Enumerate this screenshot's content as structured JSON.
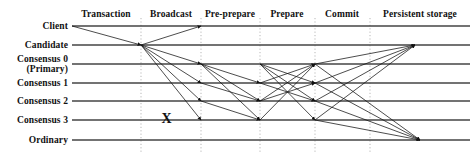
{
  "figure": {
    "width": 474,
    "height": 156,
    "background_color": "#ffffff",
    "line_color": "#444444",
    "arrow_color": "#111111",
    "divider_color": "#999999"
  },
  "phases": [
    {
      "label": "Transaction",
      "center_x": 106,
      "start_x": 72,
      "end_x": 141
    },
    {
      "label": "Broadcast",
      "center_x": 171,
      "start_x": 141,
      "end_x": 201
    },
    {
      "label": "Pre-prepare",
      "center_x": 230,
      "start_x": 201,
      "end_x": 260
    },
    {
      "label": "Prepare",
      "center_x": 287,
      "start_x": 260,
      "end_x": 315
    },
    {
      "label": "Commit",
      "center_x": 342,
      "start_x": 315,
      "end_x": 370
    },
    {
      "label": "Persistent storage",
      "center_x": 420,
      "start_x": 370,
      "end_x": 470
    }
  ],
  "phase_header_y": 10,
  "dividers_x": [
    141,
    201,
    260,
    315,
    370
  ],
  "divider_top_y": 18,
  "divider_bottom_y": 152,
  "lanes": [
    {
      "id": "client",
      "label": "Client",
      "label_lines": [
        "Client"
      ],
      "y": 26
    },
    {
      "id": "candidate",
      "label": "Candidate",
      "label_lines": [
        "Candidate"
      ],
      "y": 45
    },
    {
      "id": "consensus0",
      "label": "Consensus 0 (Primary)",
      "label_lines": [
        "Consensus 0",
        "(Primary)"
      ],
      "y": 64
    },
    {
      "id": "consensus1",
      "label": "Consensus 1",
      "label_lines": [
        "Consensus 1"
      ],
      "y": 83
    },
    {
      "id": "consensus2",
      "label": "Consensus 2",
      "label_lines": [
        "Consensus 2"
      ],
      "y": 101
    },
    {
      "id": "consensus3",
      "label": "Consensus 3",
      "label_lines": [
        "Consensus 3"
      ],
      "y": 120
    },
    {
      "id": "ordinary",
      "label": "Ordinary",
      "label_lines": [
        "Ordinary"
      ],
      "y": 140
    }
  ],
  "lane_line_start_x": 72,
  "lane_line_end_x": 470,
  "fail_marker": {
    "symbol": "X",
    "lane": "consensus3",
    "x": 166,
    "y": 120,
    "meaning": "faulty-node-marker"
  },
  "messages": [
    {
      "phase": "Transaction",
      "from_lane": "client",
      "to_lane": "candidate",
      "x1": 72,
      "y1": 26,
      "x2": 141,
      "y2": 45
    },
    {
      "phase": "Broadcast",
      "from_lane": "candidate",
      "to_lane": "client",
      "x1": 141,
      "y1": 45,
      "x2": 201,
      "y2": 26
    },
    {
      "phase": "Broadcast",
      "from_lane": "candidate",
      "to_lane": "consensus0",
      "x1": 141,
      "y1": 45,
      "x2": 201,
      "y2": 64
    },
    {
      "phase": "Broadcast",
      "from_lane": "candidate",
      "to_lane": "consensus1",
      "x1": 141,
      "y1": 45,
      "x2": 201,
      "y2": 83
    },
    {
      "phase": "Broadcast",
      "from_lane": "candidate",
      "to_lane": "consensus2",
      "x1": 141,
      "y1": 45,
      "x2": 201,
      "y2": 101
    },
    {
      "phase": "Broadcast",
      "from_lane": "candidate",
      "to_lane": "consensus3",
      "x1": 141,
      "y1": 45,
      "x2": 201,
      "y2": 120
    },
    {
      "phase": "Pre-prepare",
      "from_lane": "consensus0",
      "to_lane": "consensus1",
      "x1": 201,
      "y1": 64,
      "x2": 260,
      "y2": 83
    },
    {
      "phase": "Pre-prepare",
      "from_lane": "consensus0",
      "to_lane": "consensus2",
      "x1": 201,
      "y1": 64,
      "x2": 260,
      "y2": 101
    },
    {
      "phase": "Pre-prepare",
      "from_lane": "consensus0",
      "to_lane": "consensus3",
      "x1": 201,
      "y1": 64,
      "x2": 260,
      "y2": 120
    },
    {
      "phase": "Pre-prepare",
      "from_lane": "consensus1",
      "to_lane": "consensus2",
      "x1": 201,
      "y1": 83,
      "x2": 260,
      "y2": 101
    },
    {
      "phase": "Pre-prepare",
      "from_lane": "consensus2",
      "to_lane": "consensus3",
      "x1": 201,
      "y1": 101,
      "x2": 260,
      "y2": 120
    },
    {
      "phase": "Prepare",
      "from_lane": "consensus1",
      "to_lane": "consensus0",
      "x1": 260,
      "y1": 83,
      "x2": 315,
      "y2": 64
    },
    {
      "phase": "Prepare",
      "from_lane": "consensus2",
      "to_lane": "consensus0",
      "x1": 260,
      "y1": 101,
      "x2": 315,
      "y2": 64
    },
    {
      "phase": "Prepare",
      "from_lane": "consensus3",
      "to_lane": "consensus0",
      "x1": 260,
      "y1": 120,
      "x2": 315,
      "y2": 64
    },
    {
      "phase": "Prepare",
      "from_lane": "consensus0",
      "to_lane": "consensus1",
      "x1": 260,
      "y1": 64,
      "x2": 315,
      "y2": 83
    },
    {
      "phase": "Prepare",
      "from_lane": "consensus0",
      "to_lane": "consensus2",
      "x1": 260,
      "y1": 64,
      "x2": 315,
      "y2": 101
    },
    {
      "phase": "Prepare",
      "from_lane": "consensus0",
      "to_lane": "consensus3",
      "x1": 260,
      "y1": 64,
      "x2": 315,
      "y2": 120
    },
    {
      "phase": "Prepare",
      "from_lane": "consensus2",
      "to_lane": "consensus1",
      "x1": 260,
      "y1": 101,
      "x2": 315,
      "y2": 83
    },
    {
      "phase": "Prepare",
      "from_lane": "consensus1",
      "to_lane": "consensus2",
      "x1": 260,
      "y1": 83,
      "x2": 315,
      "y2": 101
    },
    {
      "phase": "Commit",
      "from_lane": "consensus0",
      "to_lane": "candidate",
      "x1": 315,
      "y1": 64,
      "x2": 415,
      "y2": 45
    },
    {
      "phase": "Commit",
      "from_lane": "consensus1",
      "to_lane": "candidate",
      "x1": 315,
      "y1": 83,
      "x2": 415,
      "y2": 45
    },
    {
      "phase": "Commit",
      "from_lane": "consensus2",
      "to_lane": "candidate",
      "x1": 315,
      "y1": 101,
      "x2": 415,
      "y2": 45
    },
    {
      "phase": "Commit",
      "from_lane": "consensus3",
      "to_lane": "candidate",
      "x1": 315,
      "y1": 120,
      "x2": 415,
      "y2": 45
    },
    {
      "phase": "Persistent storage",
      "from_lane": "consensus0",
      "to_lane": "ordinary",
      "x1": 315,
      "y1": 64,
      "x2": 420,
      "y2": 140
    },
    {
      "phase": "Persistent storage",
      "from_lane": "consensus1",
      "to_lane": "ordinary",
      "x1": 315,
      "y1": 83,
      "x2": 420,
      "y2": 140
    },
    {
      "phase": "Persistent storage",
      "from_lane": "consensus2",
      "to_lane": "ordinary",
      "x1": 315,
      "y1": 101,
      "x2": 420,
      "y2": 140
    },
    {
      "phase": "Persistent storage",
      "from_lane": "consensus3",
      "to_lane": "ordinary",
      "x1": 315,
      "y1": 120,
      "x2": 420,
      "y2": 140
    }
  ]
}
